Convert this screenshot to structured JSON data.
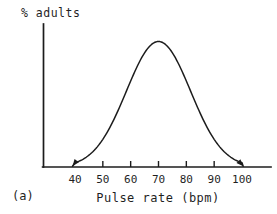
{
  "figure": {
    "panel_label": "(a)",
    "background_color": "#ffffff",
    "line_color": "#1c1c1c",
    "text_color": "#1f1f1f"
  },
  "chart_data": {
    "type": "line",
    "title": "",
    "ylabel": "% adults",
    "xlabel": "Pulse rate (bpm)",
    "x_tick_labels": [
      40,
      50,
      60,
      70,
      80,
      90,
      100
    ],
    "x_ticks_with_marks": [
      50,
      60,
      70,
      80,
      90
    ],
    "xlim": [
      40,
      100
    ],
    "grid": false,
    "legend": false,
    "y_axis_ticks": [],
    "curve": {
      "shape": "normal-distribution",
      "mean_bpm": 70,
      "sd_bpm": 11.5,
      "x_range_bpm": [
        40,
        100
      ],
      "arrowheads_at_both_tails": true
    },
    "samples": {
      "x_bpm": [
        40,
        45,
        50,
        55,
        60,
        65,
        70,
        75,
        80,
        85,
        90,
        95,
        100
      ],
      "relative_height": [
        0.03,
        0.09,
        0.22,
        0.43,
        0.68,
        0.91,
        1.0,
        0.91,
        0.68,
        0.43,
        0.22,
        0.09,
        0.03
      ]
    }
  }
}
